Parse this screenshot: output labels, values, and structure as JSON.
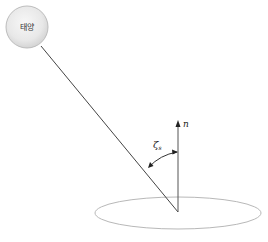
{
  "diagram": {
    "title": "",
    "sun": {
      "label": "태양",
      "fill": "#e6e6e6",
      "stroke": "#bdbdbd"
    },
    "normal": {
      "label": "n"
    },
    "zenith_angle": {
      "symbol": "ζ",
      "subscript": "s"
    },
    "surface": {
      "shape": "ellipse",
      "stroke": "#b5b5b5"
    },
    "colors": {
      "line": "#444444",
      "arrow": "#222222"
    }
  }
}
